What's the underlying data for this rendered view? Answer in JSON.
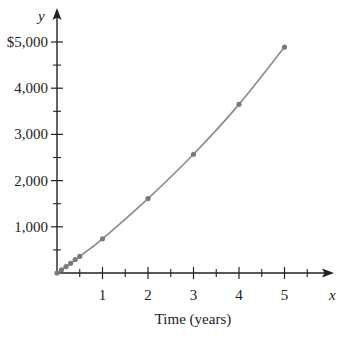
{
  "chart_data": {
    "type": "line",
    "title": "",
    "xlabel": "Time (years)",
    "ylabel": "",
    "x_axis_var": "x",
    "y_axis_var": "y",
    "xlim": [
      0,
      5.5
    ],
    "ylim": [
      0,
      5000
    ],
    "x_ticks": [
      1,
      2,
      3,
      4,
      5
    ],
    "x_tick_labels": [
      "1",
      "2",
      "3",
      "4",
      "5"
    ],
    "x_minor_ticks": [
      0.5,
      1.5,
      2.5,
      3.5,
      4.5,
      5.5
    ],
    "y_ticks": [
      1000,
      2000,
      3000,
      4000,
      5000
    ],
    "y_tick_labels": [
      "1,000",
      "2,000",
      "3,000",
      "4,000",
      "$5,000"
    ],
    "y_minor_ticks": [
      500,
      1500,
      2500,
      3500,
      4500
    ],
    "grid": false,
    "legend": null,
    "series": [
      {
        "name": "Accumulated amount",
        "style": "smooth curve with markers",
        "color": "#8a8a8a",
        "x": [
          0,
          0.1,
          0.2,
          0.3,
          0.4,
          0.5,
          1,
          2,
          3,
          4,
          5
        ],
        "values": [
          0,
          70,
          140,
          210,
          290,
          360,
          740,
          1610,
          2570,
          3650,
          4890
        ]
      }
    ]
  },
  "colors": {
    "axis": "#222222",
    "curve": "#8a8a8a",
    "marker": "#7a7a7a"
  }
}
